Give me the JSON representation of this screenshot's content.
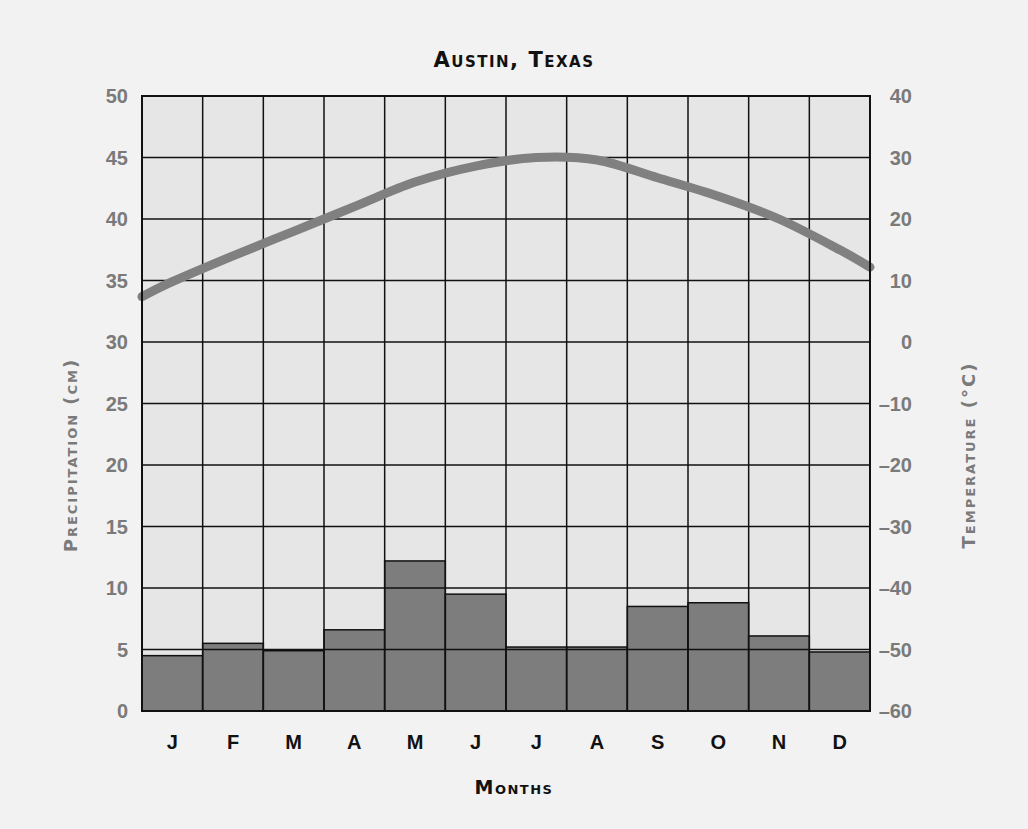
{
  "chart_data": {
    "type": "bar+line",
    "title": "Austin, Texas",
    "xlabel": "Months",
    "ylabel_left": "Precipitation (cm)",
    "ylabel_right": "Temperature (°C)",
    "categories": [
      "J",
      "F",
      "M",
      "A",
      "M",
      "J",
      "J",
      "A",
      "S",
      "O",
      "N",
      "D"
    ],
    "series": [
      {
        "name": "Precipitation (cm)",
        "type": "bar",
        "axis": "left",
        "color": "#7d7d7d",
        "values": [
          4.5,
          5.5,
          4.9,
          6.6,
          12.2,
          9.5,
          5.2,
          5.2,
          8.5,
          8.8,
          6.1,
          4.8
        ]
      },
      {
        "name": "Temperature (°C)",
        "type": "line",
        "axis": "right",
        "color": "#808080",
        "values": [
          9.8,
          14,
          18,
          22,
          26,
          28.6,
          30,
          29.6,
          26.7,
          23.7,
          20,
          15
        ]
      }
    ],
    "ylim_left": [
      0,
      50
    ],
    "ylim_right": [
      -60,
      40
    ],
    "yticks_left": [
      "0",
      "5",
      "10",
      "15",
      "20",
      "25",
      "30",
      "35",
      "40",
      "45",
      "50"
    ],
    "yticks_right": [
      "-60",
      "-50",
      "-40",
      "-30",
      "-20",
      "-10",
      "0",
      "10",
      "20",
      "30",
      "40"
    ],
    "grid": true,
    "legend": "none"
  },
  "labels": {
    "title": "Austin, Texas",
    "xlabel": "Months",
    "ylabel_left": "Precipitation (cm)",
    "ylabel_right": "Temperature (°C)"
  }
}
